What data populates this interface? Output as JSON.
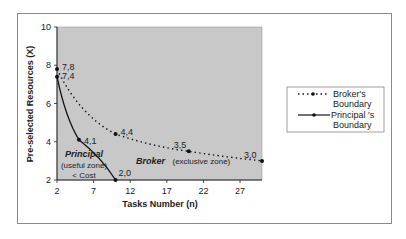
{
  "chart_data": {
    "type": "line",
    "title": "",
    "xlabel": "Tasks Number (n)",
    "ylabel": "Pre-selected Resources (X)",
    "xlim": [
      2,
      30
    ],
    "ylim": [
      2,
      10
    ],
    "xticks": [
      2,
      7,
      12,
      17,
      22,
      27
    ],
    "yticks": [
      2,
      4,
      6,
      8,
      10
    ],
    "grid": false,
    "plot_background": "#c8c8c8",
    "legend_position": "right",
    "series": [
      {
        "name": "Broker's Boundary",
        "legend_lines": [
          "Broker's",
          "Boundary"
        ],
        "style": "dotted",
        "x": [
          2,
          10,
          20,
          30
        ],
        "y": [
          7.8,
          4.4,
          3.5,
          3.0
        ],
        "labels": [
          "7,8",
          "4,4",
          "3,5",
          "3,0"
        ]
      },
      {
        "name": "Principal 's Boundary",
        "legend_lines": [
          "Principal 's",
          "Boundary"
        ],
        "style": "solid",
        "x": [
          2,
          5,
          10
        ],
        "y": [
          7.4,
          4.1,
          2.0
        ],
        "labels": [
          "7,4",
          "4,1",
          "2,0"
        ]
      }
    ],
    "annotations": {
      "principal_title": "Principal",
      "principal_line2": "(useful zone)",
      "principal_line3": "< Cost",
      "broker_title": "Broker",
      "broker_rest": "(exclusive zone)"
    }
  }
}
